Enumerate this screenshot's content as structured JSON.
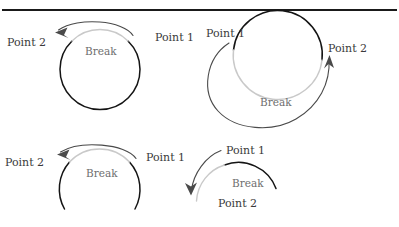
{
  "figure": {
    "type": "diagram",
    "rule_color": "#1a1a1a",
    "dark_arc_color": "#141414",
    "gray_arc_color": "#c9c9c9",
    "arrow_color": "#4a4a4a",
    "label_color": "#3a3a3a",
    "break_label_color": "#6e6e6e"
  },
  "panels": [
    {
      "id": "top-left",
      "shape": "full-circle",
      "point1_label": "Point 1",
      "point2_label": "Point 2",
      "break_label": "Break",
      "arrow_direction": "counterclockwise",
      "break_position": "top"
    },
    {
      "id": "top-right",
      "shape": "full-circle-spiral",
      "point1_label": "Point 1",
      "point2_label": "Point 2",
      "break_label": "Break",
      "arrow_direction": "clockwise",
      "break_position": "bottom"
    },
    {
      "id": "bottom-left",
      "shape": "arc",
      "point1_label": "Point 1",
      "point2_label": "Point 2",
      "break_label": "Break",
      "arrow_direction": "counterclockwise",
      "break_position": "top"
    },
    {
      "id": "bottom-right",
      "shape": "arc",
      "point1_label": "Point 1",
      "point2_label": "Point 2",
      "break_label": "Break",
      "arrow_direction": "counterclockwise",
      "break_position": "left"
    }
  ]
}
